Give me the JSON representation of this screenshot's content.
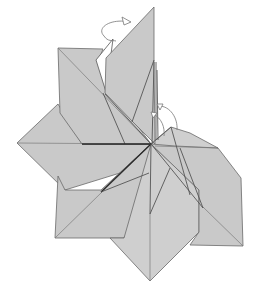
{
  "diagram": {
    "type": "origami-fold-step",
    "colors": {
      "paper": "#c9c9c9",
      "paper_light": "#cfcfcf",
      "outline": "#6a6a6a",
      "dark_edge": "#2a2a2a",
      "arrow": "#777777",
      "background": "#ffffff"
    },
    "symbols": [
      {
        "name": "fold-behind-arrow",
        "meaning": "fold the top flap behind",
        "location": "top"
      },
      {
        "name": "fold-over-arrow",
        "meaning": "fold flap over toward the center",
        "location": "right of center"
      }
    ],
    "flap_count": 7,
    "caption": ""
  }
}
